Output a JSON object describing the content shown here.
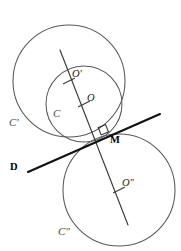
{
  "figure": {
    "width": 181,
    "height": 251,
    "background_color": "#ffffff",
    "stroke_color_circles": "#585858",
    "stroke_color_tangent": "#111111",
    "stroke_color_diameter": "#3a3a3a"
  },
  "points": [
    {
      "id": "O-prime",
      "label": "O'",
      "x": 69,
      "y": 81,
      "label_x": 72,
      "label_y": 74
    },
    {
      "id": "O",
      "label": "O",
      "x": 84,
      "y": 104,
      "label_x": 87,
      "label_y": 98
    },
    {
      "id": "M",
      "label": "M",
      "x": 107,
      "y": 137,
      "label_x": 110,
      "label_y": 140
    },
    {
      "id": "O-second",
      "label": "O\"",
      "x": 119,
      "y": 190,
      "label_x": 122,
      "label_y": 183
    }
  ],
  "curves": [
    {
      "id": "C-prime",
      "label": "C'",
      "cx": 69,
      "cy": 81,
      "r": 56,
      "label_x": 9,
      "label_y": 122
    },
    {
      "id": "C",
      "label": "C",
      "cx": 84,
      "cy": 104,
      "r": 38,
      "label_x": 53,
      "label_y": 113
    },
    {
      "id": "C-second",
      "label": "C\"",
      "cx": 119,
      "cy": 190,
      "r": 56,
      "label_x": 58,
      "label_y": 231
    }
  ],
  "lines": [
    {
      "id": "tangent-D",
      "label": "D",
      "x1": 28,
      "y1": 172,
      "x2": 160,
      "y2": 114,
      "label_x": 10,
      "label_y": 162
    },
    {
      "id": "centers-line",
      "label": "",
      "x1": 60,
      "y1": 50,
      "x2": 128,
      "y2": 225,
      "label_x": 0,
      "label_y": 0
    }
  ],
  "markers": {
    "right_angle": {
      "id": "right-angle-at-M",
      "x": 99,
      "y": 129,
      "size": 9
    },
    "tick_marks": [
      {
        "id": "tick-O-prime",
        "x": 69,
        "y": 81
      },
      {
        "id": "tick-O",
        "x": 84,
        "y": 104
      },
      {
        "id": "tick-O-second",
        "x": 119,
        "y": 190
      }
    ]
  }
}
